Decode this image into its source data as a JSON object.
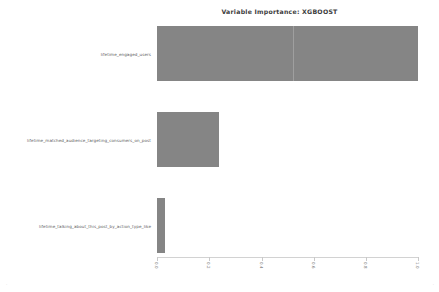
{
  "chart_data": {
    "type": "bar",
    "orientation": "horizontal",
    "title": "Variable Importance: XGBOOST",
    "xlabel": "",
    "ylabel": "",
    "grid": false,
    "legend": null,
    "xlim": [
      0.0,
      1.0
    ],
    "xticks": [
      "0.0",
      "0.2",
      "0.4",
      "0.6",
      "0.8",
      "1.0"
    ],
    "xtick_values": [
      0.0,
      0.2,
      0.4,
      0.6,
      0.8,
      1.0
    ],
    "categories": [
      "lifetime_engaged_users",
      "lifetime_matched_audience_targeting_consumers_on_post",
      "lifetime_talking_about_this_post_by_action_type_like"
    ],
    "values": [
      1.0,
      0.238,
      0.032
    ],
    "series": [
      {
        "name": "Importance",
        "values": [
          1.0,
          0.238,
          0.032
        ]
      }
    ],
    "bar_color": "#858585"
  },
  "corner_marks": {
    "left": "·",
    "right": "·"
  }
}
